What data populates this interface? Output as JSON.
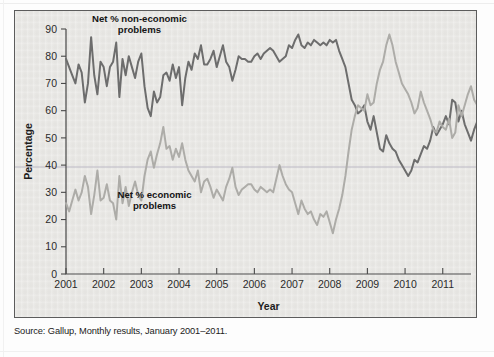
{
  "figure": {
    "source_note": "Source: Gallup, Monthly results, January 2001–2011.",
    "colors": {
      "panel_background": "#e9e8e5",
      "panel_border": "#5c5c5c",
      "non_economic_line": "#6d6d6d",
      "economic_line": "#adaca8",
      "axis": "#4a4a4a",
      "text": "#1d1d1d",
      "ruled_line": "#b9b6c4"
    }
  },
  "chart_data": {
    "type": "line",
    "title": "",
    "xlabel": "Year",
    "ylabel": "Percentage",
    "xlim": [
      2001,
      2011.75
    ],
    "ylim": [
      0,
      90
    ],
    "yticks": [
      0,
      10,
      20,
      30,
      40,
      50,
      60,
      70,
      80,
      90
    ],
    "xticks": [
      2001,
      2002,
      2003,
      2004,
      2005,
      2006,
      2007,
      2008,
      2009,
      2010,
      2011
    ],
    "xtick_labels": [
      "2001",
      "2002",
      "2003",
      "2004",
      "2005",
      "2006",
      "2007",
      "2008",
      "2009",
      "2010",
      "2011"
    ],
    "grid": false,
    "legend": "inline-annotations",
    "annotations": [
      {
        "name": "non-economic-label",
        "text": "Net % non-economic problems",
        "line1": "Net % non-economic",
        "line2": "problems",
        "x": 2002.95,
        "y": 92.5
      },
      {
        "name": "economic-label",
        "text": "Net % economic problems",
        "line1": "Net % economic",
        "line2": "problems",
        "x": 2003.35,
        "y": 28.0
      }
    ],
    "x_start": 2001.0,
    "x_step": 0.08333,
    "series": [
      {
        "name": "Net % non-economic problems",
        "color": "#6d6d6d",
        "width": 2.0,
        "values": [
          79,
          76,
          73,
          70,
          77,
          74,
          63,
          70,
          87,
          73,
          66,
          78,
          76,
          69,
          76,
          78,
          85,
          65,
          79,
          73,
          80,
          76,
          72,
          78,
          81,
          69,
          61,
          58,
          67,
          63,
          65,
          73,
          74,
          71,
          77,
          72,
          76,
          62,
          72,
          78,
          75,
          81,
          79,
          84,
          77,
          77,
          79,
          82,
          76,
          80,
          84,
          78,
          76,
          71,
          75,
          80,
          79,
          79,
          78,
          78,
          80,
          81,
          79,
          81,
          82,
          83,
          82,
          80,
          78,
          79,
          80,
          84,
          83,
          86,
          88,
          84,
          83,
          85,
          84,
          86,
          85,
          84,
          85,
          84,
          86,
          85,
          86,
          82,
          79,
          76,
          70,
          64,
          62,
          59,
          60,
          62,
          56,
          53,
          58,
          52,
          46,
          45,
          51,
          48,
          46,
          45,
          42,
          40,
          38,
          36,
          38,
          42,
          41,
          44,
          47,
          46,
          49,
          54,
          51,
          53,
          55,
          58,
          55,
          64,
          63,
          56,
          60,
          55,
          52,
          49,
          53,
          56,
          54,
          51,
          51,
          50,
          52,
          49,
          50,
          48,
          53,
          57,
          50,
          47,
          45,
          44,
          42,
          40,
          38,
          44,
          42
        ]
      },
      {
        "name": "Net % economic problems",
        "color": "#adaca8",
        "width": 2.0,
        "values": [
          26,
          23,
          27,
          31,
          27,
          30,
          36,
          32,
          22,
          29,
          38,
          27,
          28,
          33,
          27,
          26,
          20,
          36,
          26,
          32,
          25,
          30,
          34,
          29,
          27,
          36,
          42,
          45,
          39,
          44,
          48,
          54,
          46,
          47,
          42,
          46,
          43,
          48,
          42,
          38,
          36,
          34,
          38,
          30,
          34,
          35,
          32,
          28,
          31,
          29,
          27,
          32,
          35,
          39,
          32,
          29,
          31,
          32,
          33,
          33,
          31,
          30,
          32,
          31,
          30,
          31,
          30,
          35,
          40,
          36,
          33,
          31,
          30,
          26,
          22,
          27,
          24,
          22,
          23,
          20,
          18,
          22,
          21,
          23,
          19,
          15,
          20,
          24,
          29,
          36,
          45,
          53,
          58,
          62,
          61,
          60,
          66,
          62,
          63,
          70,
          75,
          78,
          84,
          88,
          84,
          78,
          74,
          70,
          68,
          66,
          63,
          59,
          61,
          67,
          63,
          60,
          57,
          53,
          52,
          56,
          54,
          53,
          57,
          50,
          52,
          62,
          58,
          62,
          66,
          69,
          64,
          62,
          64,
          67,
          66,
          68,
          65,
          71,
          70,
          72,
          68,
          66,
          71,
          74,
          76,
          75,
          73,
          76,
          78,
          76,
          74
        ]
      }
    ]
  }
}
